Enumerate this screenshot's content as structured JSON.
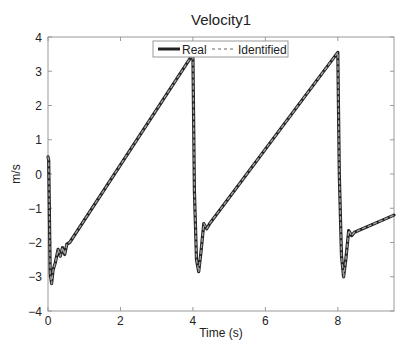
{
  "chart_data": {
    "type": "line",
    "title": "Velocity1",
    "xlabel": "Time (s)",
    "ylabel": "m/s",
    "xlim": [
      0,
      9.55
    ],
    "ylim": [
      -4,
      4
    ],
    "xticks": [
      0,
      2,
      4,
      6,
      8
    ],
    "yticks": [
      -4,
      -3,
      -2,
      -1,
      0,
      1,
      2,
      3,
      4
    ],
    "xtick_labels": [
      "0",
      "2",
      "4",
      "6",
      "8"
    ],
    "ytick_labels": [
      "-4",
      "-3",
      "-2",
      "-1",
      "0",
      "1",
      "2",
      "3",
      "4"
    ],
    "grid": false,
    "legend": {
      "position": "top-center",
      "entries": [
        "Real",
        "Identified"
      ]
    },
    "series": [
      {
        "name": "Real",
        "style": "solid",
        "color": "#222222",
        "x": [
          0.0,
          0.02,
          0.06,
          0.1,
          0.14,
          0.2,
          0.28,
          0.34,
          0.4,
          0.46,
          0.52,
          0.6,
          4.0,
          4.04,
          4.1,
          4.16,
          4.22,
          4.3,
          4.38,
          4.46,
          8.0,
          8.04,
          8.1,
          8.16,
          8.22,
          8.3,
          8.38,
          8.46,
          9.55
        ],
        "y": [
          0.5,
          0.4,
          -2.9,
          -3.2,
          -2.8,
          -2.6,
          -2.2,
          -2.4,
          -2.15,
          -2.35,
          -2.05,
          -2.0,
          3.5,
          -0.5,
          -2.5,
          -2.85,
          -2.3,
          -1.45,
          -1.6,
          -1.45,
          3.55,
          0.0,
          -2.4,
          -3.0,
          -2.5,
          -1.65,
          -1.8,
          -1.7,
          -1.2
        ]
      },
      {
        "name": "Identified",
        "style": "dashed",
        "color": "#a0a0a0",
        "x": [
          0.0,
          0.02,
          0.06,
          0.1,
          0.14,
          0.2,
          0.28,
          0.34,
          0.4,
          0.46,
          0.52,
          0.6,
          4.0,
          4.04,
          4.1,
          4.16,
          4.22,
          4.3,
          4.38,
          4.46,
          8.0,
          8.04,
          8.1,
          8.16,
          8.22,
          8.3,
          8.38,
          8.46,
          9.55
        ],
        "y": [
          0.5,
          0.4,
          -2.9,
          -3.2,
          -2.8,
          -2.6,
          -2.2,
          -2.4,
          -2.15,
          -2.35,
          -2.05,
          -2.0,
          3.5,
          -0.5,
          -2.5,
          -2.85,
          -2.3,
          -1.45,
          -1.6,
          -1.45,
          3.55,
          0.0,
          -2.4,
          -3.0,
          -2.5,
          -1.65,
          -1.8,
          -1.7,
          -1.2
        ]
      }
    ]
  },
  "layout": {
    "plot_left": 48,
    "plot_right": 394,
    "plot_top": 37,
    "plot_bottom": 311
  }
}
